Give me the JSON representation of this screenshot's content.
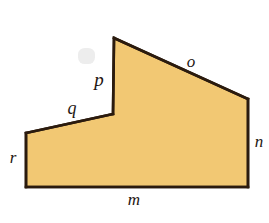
{
  "figure": {
    "kind": "labeled-polygon-diagram",
    "background_color": "#ffffff",
    "fill_color": "#f2c873",
    "fill_color_shadow": "#e7b95e",
    "stroke_color": "#2b1b0e",
    "stroke_width": 2.6,
    "label_color": "#1d1510",
    "canvas": {
      "width": 269,
      "height": 223
    },
    "vertices": [
      {
        "name": "apex",
        "x": 114,
        "y": 38
      },
      {
        "name": "right-upper",
        "x": 248,
        "y": 99
      },
      {
        "name": "bottom-right",
        "x": 248,
        "y": 187
      },
      {
        "name": "bottom-left",
        "x": 26,
        "y": 187
      },
      {
        "name": "left-upper",
        "x": 26,
        "y": 133
      },
      {
        "name": "notch",
        "x": 113,
        "y": 114
      }
    ],
    "path": "M 114 38 L 248 99 L 248 187 L 26 187 L 26 133 L 113 114 Z"
  },
  "labels": {
    "o": {
      "text": "o",
      "x": 191,
      "y": 61,
      "size": 17
    },
    "n": {
      "text": "n",
      "x": 259,
      "y": 141,
      "size": 17
    },
    "m": {
      "text": "m",
      "x": 134,
      "y": 199,
      "size": 17
    },
    "r": {
      "text": "r",
      "x": 13,
      "y": 157,
      "size": 17
    },
    "q": {
      "text": "q",
      "x": 72,
      "y": 108,
      "size": 18
    },
    "p": {
      "text": "p",
      "x": 99,
      "y": 79,
      "size": 19
    }
  },
  "artifact": {
    "name": "faint-scan-smudge",
    "x": 78,
    "y": 48,
    "width": 17,
    "height": 16,
    "color": "#ededed"
  }
}
